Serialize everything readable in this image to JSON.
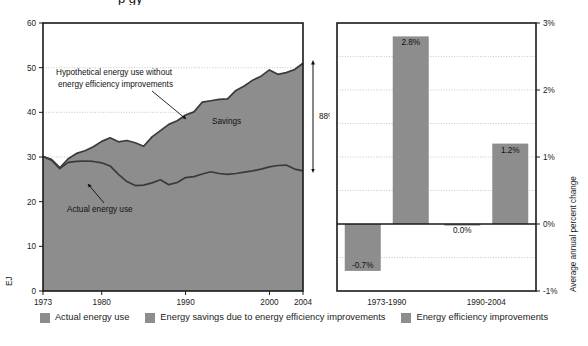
{
  "figure": {
    "cut_off_title": "p    gy",
    "background": "#ffffff",
    "series_fill": "#8d8d8d",
    "line_color": "#3a3a3a",
    "frame_color": "#1a1a1a",
    "grid_color": "#b9b9b9"
  },
  "left_chart": {
    "ylabel": "EJ",
    "y_ticks": [
      "0",
      "10",
      "20",
      "30",
      "40",
      "50",
      "60"
    ],
    "x_ticks": [
      "1973",
      "1980",
      "1990",
      "2000",
      "2004"
    ],
    "annotations": {
      "hypothetical_line1": "Hypothetical energy use without",
      "hypothetical_line2": "energy efficiency improvements",
      "actual": "Actual energy use",
      "savings": "Savings",
      "bracket": "88%"
    }
  },
  "right_chart": {
    "ylabel": "Average annual percent change",
    "y_ticks": [
      "3%",
      "2%",
      "1%",
      "0%",
      "-1%"
    ],
    "x_ticks": [
      "1973-1990",
      "1990-2004"
    ],
    "bar_labels": [
      "-0.7%",
      "2.8%",
      "0.0%",
      "1.2%"
    ]
  },
  "legend": {
    "items": [
      {
        "label": "Actual energy use",
        "color": "#8d8d8d"
      },
      {
        "label": "Energy savings due to energy efficiency improvements",
        "color": "#8d8d8d"
      },
      {
        "label": "Energy efficiency improvements",
        "color": "#8d8d8d"
      }
    ]
  },
  "chart_data": [
    {
      "type": "area",
      "id": "energy-use-area",
      "title": "",
      "xlabel": "",
      "ylabel": "EJ",
      "ylim": [
        0,
        60
      ],
      "xlim": [
        1973,
        2004
      ],
      "grid": true,
      "x": [
        1973,
        1974,
        1975,
        1976,
        1977,
        1978,
        1979,
        1980,
        1981,
        1982,
        1983,
        1984,
        1985,
        1986,
        1987,
        1988,
        1989,
        1990,
        1991,
        1992,
        1993,
        1994,
        1995,
        1996,
        1997,
        1998,
        1999,
        2000,
        2001,
        2002,
        2003,
        2004
      ],
      "series": [
        {
          "name": "Actual energy use",
          "values": [
            30.1,
            29.3,
            27.4,
            28.8,
            29.0,
            29.1,
            29.0,
            28.7,
            28.0,
            26.1,
            24.5,
            23.6,
            23.7,
            24.2,
            24.9,
            23.8,
            24.3,
            25.4,
            25.6,
            26.2,
            26.7,
            26.3,
            26.1,
            26.3,
            26.6,
            26.9,
            27.3,
            27.8,
            28.1,
            28.2,
            27.3,
            26.9
          ]
        },
        {
          "name": "Hypothetical energy use without energy efficiency improvements",
          "values": [
            30.1,
            29.5,
            27.6,
            29.6,
            30.8,
            31.4,
            32.3,
            33.5,
            34.3,
            33.4,
            33.7,
            33.2,
            32.4,
            34.5,
            35.9,
            37.3,
            38.1,
            39.4,
            40.1,
            42.3,
            42.6,
            42.9,
            43.0,
            44.9,
            45.9,
            47.2,
            48.1,
            49.5,
            48.5,
            48.9,
            49.6,
            51.0
          ]
        }
      ],
      "shaded_region": {
        "name": "Energy savings due to energy efficiency improvements",
        "between": [
          "Actual energy use",
          "Hypothetical energy use without energy efficiency improvements"
        ]
      },
      "annotations": [
        {
          "text": "Hypothetical energy use without energy efficiency improvements",
          "points_to_year": 1987,
          "points_to_value": 40
        },
        {
          "text": "Actual energy use",
          "points_to_year": 1984,
          "points_to_value": 24
        },
        {
          "text": "Savings",
          "at_year": 1996,
          "at_value": 37
        },
        {
          "text": "88%",
          "bracket_from": 27,
          "bracket_to": 51,
          "at_year": 2005
        }
      ]
    },
    {
      "type": "bar",
      "id": "annual-percent-change",
      "title": "",
      "xlabel": "",
      "ylabel": "Average annual percent change",
      "ylim": [
        -1,
        3
      ],
      "grid": true,
      "categories": [
        "1973-1990",
        "1990-2004"
      ],
      "series": [
        {
          "name": "Actual energy use",
          "values": [
            -0.7,
            0.0
          ]
        },
        {
          "name": "Energy efficiency improvements",
          "values": [
            2.8,
            1.2
          ]
        }
      ],
      "data_labels": [
        "-0.7%",
        "2.8%",
        "0.0%",
        "1.2%"
      ]
    }
  ]
}
